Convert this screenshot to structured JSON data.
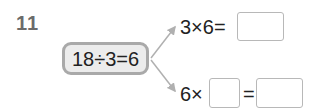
{
  "question": {
    "number": "11",
    "given": "18÷3=6",
    "top": {
      "left": "3×6=",
      "answer": ""
    },
    "bottom": {
      "left": "6×",
      "blank": "",
      "equals": "=",
      "answer": ""
    }
  },
  "colors": {
    "given_border": "#a9a9a9",
    "given_fill": "#ececec",
    "arrow": "#b0b0b0",
    "box_border": "#b8b8b8"
  }
}
